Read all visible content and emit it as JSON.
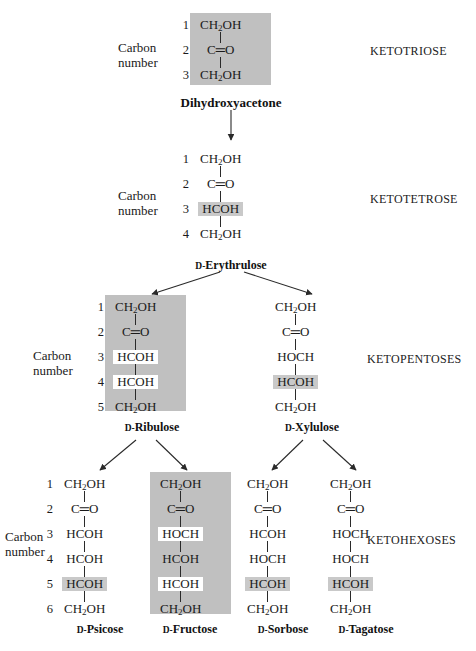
{
  "diagram": {
    "carbon_number_label_line1": "Carbon",
    "carbon_number_label_line2": "number",
    "d_prefix": "D-",
    "classes": [
      {
        "id": "ketotriose",
        "label": "KETOTRIOSE"
      },
      {
        "id": "ketotetrose",
        "label": "KETOTETROSE"
      },
      {
        "id": "ketopentoses",
        "label": "KETOPENTOSES"
      },
      {
        "id": "ketohexoses",
        "label": "KETOHEXOSES"
      }
    ],
    "molecules": [
      {
        "id": "dihydroxyacetone",
        "name": "Dihydroxyacetone",
        "name_has_d_prefix": false,
        "boxed": true,
        "carbon_numbers": [
          "1",
          "2",
          "3"
        ],
        "show_carbon_numbers": true,
        "show_carbon_label": true,
        "rows": [
          {
            "text": "CH2OH",
            "highlight": "none"
          },
          {
            "text": "C=O",
            "highlight": "none"
          },
          {
            "text": "CH2OH",
            "highlight": "none"
          }
        ]
      },
      {
        "id": "d-erythrulose",
        "name": "Erythrulose",
        "name_has_d_prefix": true,
        "boxed": false,
        "carbon_numbers": [
          "1",
          "2",
          "3",
          "4"
        ],
        "show_carbon_numbers": true,
        "show_carbon_label": true,
        "rows": [
          {
            "text": "CH2OH",
            "highlight": "none"
          },
          {
            "text": "C=O",
            "highlight": "none"
          },
          {
            "text": "HCOH",
            "highlight": "gray"
          },
          {
            "text": "CH2OH",
            "highlight": "none"
          }
        ]
      },
      {
        "id": "d-ribulose",
        "name": "Ribulose",
        "name_has_d_prefix": true,
        "boxed": true,
        "carbon_numbers": [
          "1",
          "2",
          "3",
          "4",
          "5"
        ],
        "show_carbon_numbers": true,
        "show_carbon_label": true,
        "rows": [
          {
            "text": "CH2OH",
            "highlight": "none"
          },
          {
            "text": "C=O",
            "highlight": "none"
          },
          {
            "text": "HCOH",
            "highlight": "white"
          },
          {
            "text": "HCOH",
            "highlight": "white"
          },
          {
            "text": "CH2OH",
            "highlight": "none"
          }
        ]
      },
      {
        "id": "d-xylulose",
        "name": "Xylulose",
        "name_has_d_prefix": true,
        "boxed": false,
        "carbon_numbers": [
          "1",
          "2",
          "3",
          "4",
          "5"
        ],
        "show_carbon_numbers": false,
        "show_carbon_label": false,
        "rows": [
          {
            "text": "CH2OH",
            "highlight": "none"
          },
          {
            "text": "C=O",
            "highlight": "none"
          },
          {
            "text": "HOCH",
            "highlight": "none"
          },
          {
            "text": "HCOH",
            "highlight": "gray"
          },
          {
            "text": "CH2OH",
            "highlight": "none"
          }
        ]
      },
      {
        "id": "d-psicose",
        "name": "Psicose",
        "name_has_d_prefix": true,
        "boxed": false,
        "carbon_numbers": [
          "1",
          "2",
          "3",
          "4",
          "5",
          "6"
        ],
        "show_carbon_numbers": true,
        "show_carbon_label": true,
        "rows": [
          {
            "text": "CH2OH",
            "highlight": "none"
          },
          {
            "text": "C=O",
            "highlight": "none"
          },
          {
            "text": "HCOH",
            "highlight": "none"
          },
          {
            "text": "HCOH",
            "highlight": "none"
          },
          {
            "text": "HCOH",
            "highlight": "gray"
          },
          {
            "text": "CH2OH",
            "highlight": "none"
          }
        ]
      },
      {
        "id": "d-fructose",
        "name": "Fructose",
        "name_has_d_prefix": true,
        "boxed": true,
        "carbon_numbers": [
          "1",
          "2",
          "3",
          "4",
          "5",
          "6"
        ],
        "show_carbon_numbers": false,
        "show_carbon_label": false,
        "rows": [
          {
            "text": "CH2OH",
            "highlight": "none"
          },
          {
            "text": "C=O",
            "highlight": "none"
          },
          {
            "text": "HOCH",
            "highlight": "white"
          },
          {
            "text": "HCOH",
            "highlight": "none"
          },
          {
            "text": "HCOH",
            "highlight": "white"
          },
          {
            "text": "CH2OH",
            "highlight": "none"
          }
        ]
      },
      {
        "id": "d-sorbose",
        "name": "Sorbose",
        "name_has_d_prefix": true,
        "boxed": false,
        "carbon_numbers": [
          "1",
          "2",
          "3",
          "4",
          "5",
          "6"
        ],
        "show_carbon_numbers": false,
        "show_carbon_label": false,
        "rows": [
          {
            "text": "CH2OH",
            "highlight": "none"
          },
          {
            "text": "C=O",
            "highlight": "none"
          },
          {
            "text": "HCOH",
            "highlight": "none"
          },
          {
            "text": "HOCH",
            "highlight": "none"
          },
          {
            "text": "HCOH",
            "highlight": "gray"
          },
          {
            "text": "CH2OH",
            "highlight": "none"
          }
        ]
      },
      {
        "id": "d-tagatose",
        "name": "Tagatose",
        "name_has_d_prefix": true,
        "boxed": false,
        "carbon_numbers": [
          "1",
          "2",
          "3",
          "4",
          "5",
          "6"
        ],
        "show_carbon_numbers": false,
        "show_carbon_label": false,
        "rows": [
          {
            "text": "CH2OH",
            "highlight": "none"
          },
          {
            "text": "C=O",
            "highlight": "none"
          },
          {
            "text": "HOCH",
            "highlight": "none"
          },
          {
            "text": "HOCH",
            "highlight": "none"
          },
          {
            "text": "HCOH",
            "highlight": "gray"
          },
          {
            "text": "CH2OH",
            "highlight": "none"
          }
        ]
      }
    ],
    "colors": {
      "shade_box": "#c0c0c0",
      "highlight_gray": "#c9c9c9",
      "highlight_white": "#ffffff",
      "ink": "#1a1a1a",
      "page": "#ffffff"
    }
  }
}
